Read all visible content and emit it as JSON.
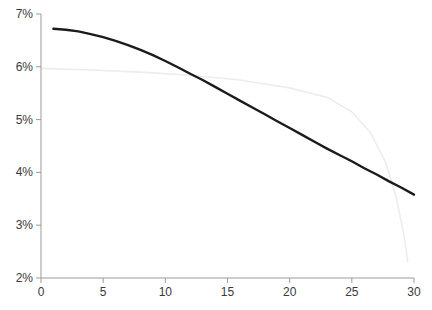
{
  "chart_data": {
    "type": "line",
    "title": "",
    "xlabel": "",
    "ylabel": "",
    "xlim": [
      0,
      30
    ],
    "ylim": [
      2,
      7
    ],
    "grid": "off",
    "legend": "none",
    "axis_color": "#9b9b9b",
    "tick_label_color": "#3a3a3a",
    "x_ticks": [
      0,
      5,
      10,
      15,
      20,
      25,
      30
    ],
    "x_tick_labels": [
      "0",
      "5",
      "10",
      "15",
      "20",
      "25",
      "30"
    ],
    "y_ticks": [
      7,
      6,
      5,
      4,
      3,
      2
    ],
    "y_tick_labels": [
      "7%",
      "6%",
      "5%",
      "4%",
      "3%",
      "2%"
    ],
    "series": [
      {
        "name": "primary-declining-curve",
        "color": "#1b1b1b",
        "stroke_width": 2.4,
        "points": [
          [
            1,
            6.72
          ],
          [
            2,
            6.7
          ],
          [
            3,
            6.67
          ],
          [
            4,
            6.62
          ],
          [
            5,
            6.56
          ],
          [
            6,
            6.49
          ],
          [
            7,
            6.41
          ],
          [
            8,
            6.32
          ],
          [
            9,
            6.22
          ],
          [
            10,
            6.11
          ],
          [
            11,
            5.99
          ],
          [
            12,
            5.87
          ],
          [
            13,
            5.75
          ],
          [
            14,
            5.62
          ],
          [
            15,
            5.49
          ],
          [
            16,
            5.36
          ],
          [
            17,
            5.23
          ],
          [
            18,
            5.1
          ],
          [
            19,
            4.97
          ],
          [
            20,
            4.84
          ],
          [
            21,
            4.71
          ],
          [
            22,
            4.58
          ],
          [
            23,
            4.45
          ],
          [
            24,
            4.33
          ],
          [
            25,
            4.21
          ],
          [
            26,
            4.08
          ],
          [
            27,
            3.96
          ],
          [
            28,
            3.83
          ],
          [
            29,
            3.71
          ],
          [
            30,
            3.58
          ]
        ]
      },
      {
        "name": "faint-secondary-curve",
        "color": "#ededed",
        "stroke_width": 1.6,
        "points": [
          [
            0,
            5.97
          ],
          [
            4,
            5.94
          ],
          [
            8,
            5.9
          ],
          [
            12,
            5.84
          ],
          [
            16,
            5.75
          ],
          [
            20,
            5.6
          ],
          [
            23,
            5.42
          ],
          [
            25,
            5.15
          ],
          [
            26.5,
            4.75
          ],
          [
            27.7,
            4.2
          ],
          [
            28.6,
            3.5
          ],
          [
            29.2,
            2.8
          ],
          [
            29.5,
            2.3
          ]
        ]
      }
    ],
    "layout": {
      "width": 432,
      "height": 310,
      "x0_px": 41,
      "px_per_x_unit": 12.433,
      "ytop_px": 14,
      "px_per_y_unit": 52.8,
      "tick_len": 5
    }
  }
}
